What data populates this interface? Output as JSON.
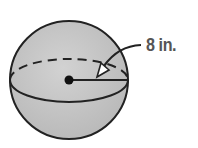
{
  "figure": {
    "shape": "sphere",
    "radius_label": "8 in.",
    "colors": {
      "fill": "#c4c4c4",
      "stroke": "#222222",
      "label": "#555555"
    }
  }
}
